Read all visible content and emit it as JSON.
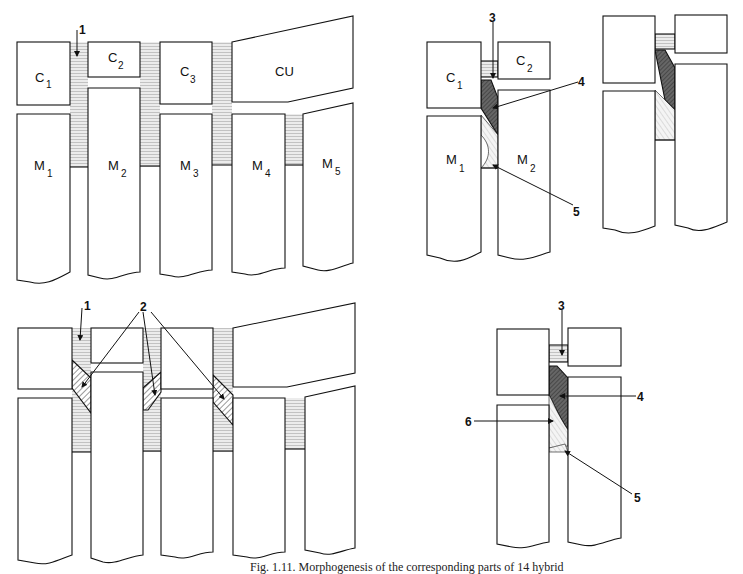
{
  "figure": {
    "panel_a": {
      "cells": {
        "c1": {
          "base": "C",
          "sub": "1"
        },
        "c2": {
          "base": "C",
          "sub": "2"
        },
        "c3": {
          "base": "C",
          "sub": "3"
        },
        "cu": {
          "base": "CU",
          "sub": ""
        },
        "m1": {
          "base": "M",
          "sub": "1"
        },
        "m2": {
          "base": "M",
          "sub": "2"
        },
        "m3": {
          "base": "M",
          "sub": "3"
        },
        "m4": {
          "base": "M",
          "sub": "4"
        },
        "m5": {
          "base": "M",
          "sub": "5"
        }
      },
      "callouts": [
        "1"
      ]
    },
    "panel_b": {
      "cells": {
        "c1": {
          "base": "C",
          "sub": "1"
        },
        "c2": {
          "base": "C",
          "sub": "2"
        },
        "m1": {
          "base": "M",
          "sub": "1"
        },
        "m2": {
          "base": "M",
          "sub": "2"
        }
      },
      "callouts": [
        "3",
        "4",
        "5"
      ]
    },
    "panel_c": {
      "callouts": []
    },
    "panel_d": {
      "callouts": [
        "1",
        "2"
      ]
    },
    "panel_e": {
      "callouts": [
        "3",
        "4",
        "6",
        "5"
      ]
    },
    "caption": "Fig. 1.11. Morphogenesis of the corresponding parts of 14 hybrid"
  }
}
